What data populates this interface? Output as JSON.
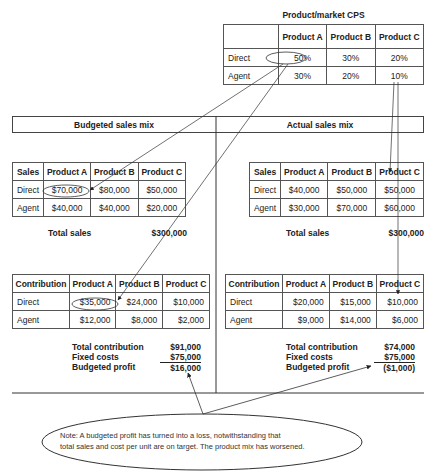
{
  "cps": {
    "title": "Product/market CPS",
    "headers": [
      "",
      "Product A",
      "Product B",
      "Product C"
    ],
    "rows": [
      {
        "label": "Direct",
        "values": [
          "50%",
          "30%",
          "20%"
        ]
      },
      {
        "label": "Agent",
        "values": [
          "30%",
          "20%",
          "10%"
        ]
      }
    ]
  },
  "sections": {
    "budgeted": "Budgeted sales mix",
    "actual": "Actual sales mix"
  },
  "budgeted_sales": {
    "headers": [
      "Sales",
      "Product A",
      "Product B",
      "Product C"
    ],
    "rows": [
      {
        "label": "Direct",
        "values": [
          "$70,000",
          "$80,000",
          "$50,000"
        ]
      },
      {
        "label": "Agent",
        "values": [
          "$40,000",
          "$40,000",
          "$20,000"
        ]
      }
    ],
    "total_label": "Total sales",
    "total_value": "$300,000"
  },
  "actual_sales": {
    "headers": [
      "Sales",
      "Product A",
      "Product B",
      "Product C"
    ],
    "rows": [
      {
        "label": "Direct",
        "values": [
          "$40,000",
          "$50,000",
          "$50,000"
        ]
      },
      {
        "label": "Agent",
        "values": [
          "$30,000",
          "$70,000",
          "$60,000"
        ]
      }
    ],
    "total_label": "Total sales",
    "total_value": "$300,000"
  },
  "budgeted_contribution": {
    "headers": [
      "Contribution",
      "Product A",
      "Product B",
      "Product C"
    ],
    "rows": [
      {
        "label": "Direct",
        "values": [
          "$35,000",
          "$24,000",
          "$10,000"
        ]
      },
      {
        "label": "Agent",
        "values": [
          "$12,000",
          "$8,000",
          "$2,000"
        ]
      }
    ],
    "summary": [
      {
        "label": "Total contribution",
        "value": "$91,000"
      },
      {
        "label": "Fixed costs",
        "value": "$75,000"
      },
      {
        "label": "Budgeted profit",
        "value": "$16,000"
      }
    ]
  },
  "actual_contribution": {
    "headers": [
      "Contribution",
      "Product A",
      "Product B",
      "Product C"
    ],
    "rows": [
      {
        "label": "Direct",
        "values": [
          "$20,000",
          "$15,000",
          "$10,000"
        ]
      },
      {
        "label": "Agent",
        "values": [
          "$9,000",
          "$14,000",
          "$6,000"
        ]
      }
    ],
    "summary": [
      {
        "label": "Total contribution",
        "value": "$74,000"
      },
      {
        "label": "Fixed costs",
        "value": "$75,000"
      },
      {
        "label": "Budgeted profit",
        "value": "($1,000)"
      }
    ]
  },
  "note": {
    "line1": "Note: A budgeted profit has turned into a loss, notwithstanding that",
    "line2": "total sales and cost per unit are on target. The product mix has worsened."
  }
}
